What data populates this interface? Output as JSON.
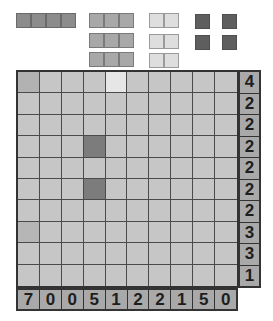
{
  "fleet": {
    "ships": [
      {
        "size": 4,
        "count": 1
      },
      {
        "size": 3,
        "count": 3
      },
      {
        "size": 2,
        "count": 3
      },
      {
        "size": 1,
        "count": 4
      }
    ]
  },
  "board": {
    "rows": 10,
    "cols": 10,
    "row_clues": [
      "4",
      "2",
      "2",
      "2",
      "2",
      "2",
      "2",
      "3",
      "3",
      "1"
    ],
    "col_clues": [
      "7",
      "0",
      "0",
      "5",
      "1",
      "2",
      "2",
      "1",
      "5",
      "0"
    ],
    "marked_cells": [
      {
        "row": 0,
        "col": 0,
        "state": "ship-mid"
      },
      {
        "row": 0,
        "col": 4,
        "state": "light"
      },
      {
        "row": 3,
        "col": 3,
        "state": "dark"
      },
      {
        "row": 5,
        "col": 3,
        "state": "dark"
      },
      {
        "row": 7,
        "col": 0,
        "state": "tint"
      }
    ]
  },
  "colors": {
    "cell_default": "#c6c6c6",
    "clue_bg": "#a9a9a9",
    "grid_line": "#4a4a4a",
    "border": "#333333"
  }
}
